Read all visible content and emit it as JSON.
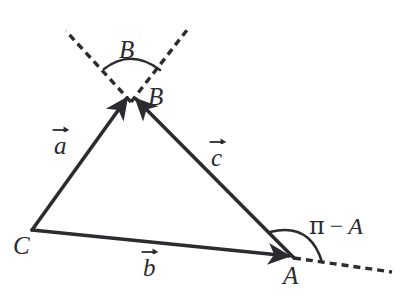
{
  "figure": {
    "background_color": "#ffffff",
    "stroke_color": "#2b2b30",
    "text_color": "#2b2b30"
  },
  "points": {
    "A": {
      "label": "A",
      "x": 294,
      "y": 258
    },
    "B": {
      "label": "B",
      "x": 131,
      "y": 102
    },
    "C": {
      "label": "C",
      "x": 32,
      "y": 230
    }
  },
  "vectors": [
    {
      "name": "a",
      "label": "a",
      "from": "C",
      "to": "B",
      "style": "solid",
      "arrow": true,
      "label_x": 62,
      "label_y": 148
    },
    {
      "name": "b",
      "label": "b",
      "from": "C",
      "to": "A",
      "style": "solid",
      "arrow": true,
      "label_x": 150,
      "label_y": 270
    },
    {
      "name": "c",
      "label": "c",
      "from": "B",
      "to": "A",
      "style": "solid",
      "arrow": true,
      "label_x": 218,
      "label_y": 160
    }
  ],
  "dashed_rays": [
    {
      "name": "ray-b-upper-left",
      "from": "B",
      "to_x": 66,
      "to_y": 31
    },
    {
      "name": "ray-b-upper-right",
      "from": "B",
      "to_x": 187,
      "to_y": 30
    },
    {
      "name": "ray-a-right",
      "from": "A",
      "to_x": 392,
      "to_y": 272
    }
  ],
  "angles": [
    {
      "name": "angle-at-B",
      "label": "B",
      "vertex": "B",
      "label_x": 128,
      "label_y": 52,
      "arc_radius": 42
    },
    {
      "name": "angle-at-A",
      "label_pi": "π",
      "label_minus": "−",
      "label_var": "A",
      "vertex": "A",
      "label_x": 330,
      "label_y": 228,
      "arc_radius": 32
    }
  ],
  "vertex_labels": {
    "A": {
      "text": "A",
      "x": 292,
      "y": 278
    },
    "B": {
      "text": "B",
      "x": 155,
      "y": 100
    },
    "C": {
      "text": "C",
      "x": 24,
      "y": 248
    }
  }
}
